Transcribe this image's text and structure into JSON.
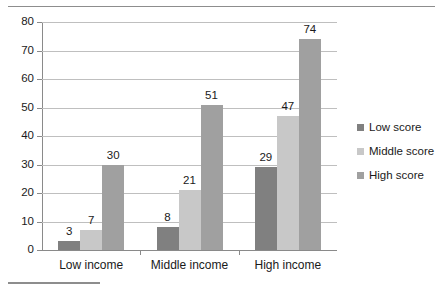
{
  "chart_data": {
    "type": "bar",
    "title": "",
    "subtitle": "",
    "xlabel": "",
    "ylabel": "",
    "ylim": [
      0,
      80
    ],
    "ytick_step": 10,
    "yticks": [
      80,
      70,
      60,
      50,
      40,
      30,
      20,
      10,
      0
    ],
    "grid": true,
    "legend_position": "right",
    "grouped": true,
    "categories": [
      "Low income",
      "Middle income",
      "High income"
    ],
    "series": [
      {
        "name": "Low score",
        "color": "#808080",
        "values": [
          3,
          8,
          29
        ]
      },
      {
        "name": "Middle score",
        "color": "#c8c8c8",
        "values": [
          7,
          21,
          47
        ]
      },
      {
        "name": "High score",
        "color": "#a0a0a0",
        "values": [
          30,
          51,
          74
        ]
      }
    ],
    "data_labels": [
      [
        "3",
        "7",
        "30"
      ],
      [
        "8",
        "21",
        "51"
      ],
      [
        "29",
        "47",
        "74"
      ]
    ]
  },
  "legend": {
    "items": [
      {
        "label": "Low score",
        "color": "#808080"
      },
      {
        "label": "Middle score",
        "color": "#c8c8c8"
      },
      {
        "label": "High score",
        "color": "#a0a0a0"
      }
    ]
  },
  "axis": {
    "y_tick_labels": [
      "80",
      "70",
      "60",
      "50",
      "40",
      "30",
      "20",
      "10",
      "0"
    ],
    "category_labels": [
      "Low income",
      "Middle income",
      "High income"
    ]
  },
  "colors": {
    "grid": "#bfbfbf",
    "axis": "#8a8a8a",
    "rule": "#8d8d8d",
    "text": "#1a1a1a",
    "background": "#ffffff"
  }
}
